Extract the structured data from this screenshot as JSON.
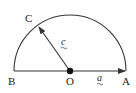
{
  "diagram": {
    "type": "semicircle-vectors",
    "colors": {
      "stroke": "#333333",
      "background": "#ffffff",
      "text": "#222222"
    },
    "points": {
      "O": {
        "label": "O",
        "x": 70,
        "y": 71
      },
      "A": {
        "label": "A",
        "x": 126,
        "y": 71
      },
      "B": {
        "label": "B",
        "x": 14,
        "y": 71
      },
      "C": {
        "label": "C",
        "x": 38,
        "y": 25
      }
    },
    "vectors": [
      {
        "name": "a",
        "label": "a",
        "from": "O",
        "to": "A"
      },
      {
        "name": "c",
        "label": "c",
        "from": "O",
        "to": "C"
      }
    ]
  }
}
